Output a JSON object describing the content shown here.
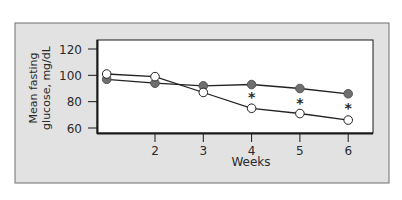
{
  "chart_data": {
    "type": "line",
    "title": "",
    "xlabel": "Weeks",
    "ylabel": "Mean fasting glucose, mg/dL",
    "ylabel_lines": [
      "Mean fasting",
      "glucose, mg/dL"
    ],
    "x": [
      1,
      2,
      3,
      4,
      5,
      6
    ],
    "x_tick_labels": [
      "",
      "2",
      "3",
      "4",
      "5",
      "6"
    ],
    "y_ticks": [
      60,
      80,
      100,
      120
    ],
    "ylim": [
      60,
      120
    ],
    "xlim": [
      0.8,
      6.5
    ],
    "grid": false,
    "legend": null,
    "series": [
      {
        "name": "Open circles",
        "marker": "open-circle",
        "values": [
          101,
          99,
          87,
          75,
          71,
          66
        ]
      },
      {
        "name": "Filled circles",
        "marker": "filled-circle",
        "values": [
          97,
          94,
          92,
          93,
          90,
          86
        ]
      }
    ],
    "annotations": [
      {
        "x": 4,
        "y": 84,
        "text": "*",
        "meaning": "significant difference"
      },
      {
        "x": 5,
        "y": 80,
        "text": "*",
        "meaning": "significant difference"
      },
      {
        "x": 6,
        "y": 76,
        "text": "*",
        "meaning": "significant difference"
      }
    ]
  },
  "colors": {
    "panel_background": "#e2e2e2",
    "panel_border": "#6e6e6e",
    "plot_background": "#ffffff",
    "axis": "#1a1a1a",
    "line": "#222222",
    "filled_marker": "#6f6f6f",
    "open_marker_fill": "#ffffff"
  }
}
